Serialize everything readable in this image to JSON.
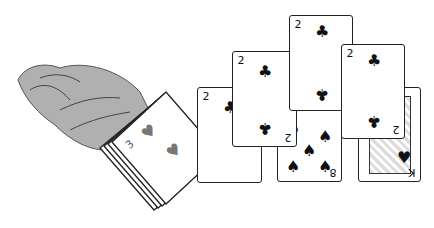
{
  "illustration": {
    "description": "Hand dealing cards from a deck; arrows show 2 of clubs moving across a row of cards",
    "colors": {
      "hand": "#b0b0b0",
      "hand_outline": "#555555",
      "arrow": "#555555",
      "card": "#ffffff",
      "ink": "#111111",
      "heart": "#777777"
    },
    "deck": {
      "top_card_rank": "3",
      "top_card_suit": "♥",
      "pip": "♥",
      "under_card_rank": "Q",
      "under_card_suit": "♠"
    },
    "cards": [
      {
        "id": "card-1",
        "rank": "2",
        "suit": "♣"
      },
      {
        "id": "card-2",
        "rank": "2",
        "suit": "♣"
      },
      {
        "id": "card-3",
        "rank": "2",
        "suit": "♣"
      },
      {
        "id": "card-4",
        "rank": "2",
        "suit": "♣"
      },
      {
        "id": "card-eight",
        "rank": "8",
        "suit": "♠"
      },
      {
        "id": "card-king",
        "rank": "K",
        "suit": "♥"
      }
    ]
  }
}
